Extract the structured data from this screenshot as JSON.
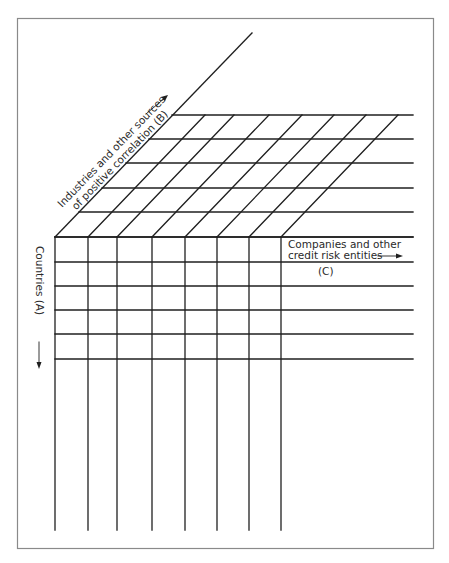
{
  "diagram": {
    "type": "3d-grid-cube",
    "axis_b": {
      "line1": "Industries and other sources",
      "line2": "of positive correlation  (B)",
      "direction": "up-right"
    },
    "axis_a": {
      "label": "Countries  (A)",
      "direction": "down"
    },
    "axis_c": {
      "line1": "Companies and other",
      "line2": "credit risk entities",
      "tag": "(C)",
      "direction": "right"
    },
    "grid": {
      "front_columns_x": [
        55,
        88,
        117,
        152,
        185,
        217,
        249,
        281
      ],
      "top_rows_y": [
        115,
        139,
        163,
        188,
        212,
        237
      ],
      "front_rows_y": [
        237,
        262,
        286,
        310,
        334,
        359
      ],
      "depth_offset_x": 117,
      "right_extent_x": 413,
      "bottom_extent_y": 530
    },
    "colors": {
      "line": "#1f1f1f",
      "frame": "#8a8a8a",
      "text": "#2a2a2a"
    }
  }
}
